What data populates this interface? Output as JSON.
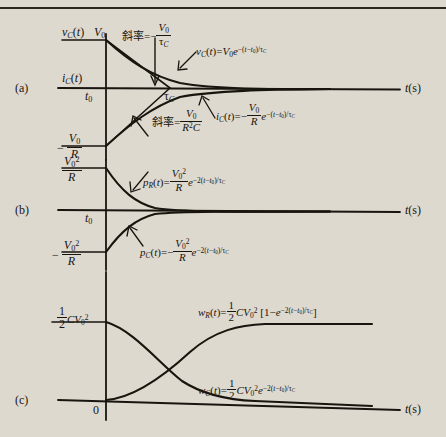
{
  "figure": {
    "background_color": "#ded9cf",
    "ink_color": "#18150f",
    "panels": [
      {
        "id": "a",
        "label": "(a)",
        "axis_label": "t(s)",
        "origin_label": "t_0"
      },
      {
        "id": "b",
        "label": "(b)",
        "axis_label": "t(s)",
        "origin_label": "t_0"
      },
      {
        "id": "c",
        "label": "(c)",
        "axis_label": "t(s)",
        "origin_label": "0"
      }
    ],
    "panel_a": {
      "panel_label": "(a)",
      "y_axis_top_label": "v_C(t)",
      "y_axis_top_value": "V_0",
      "y_axis_mid_label": "i_C(t)",
      "y_axis_neg_value": "- V_0/R",
      "origin_label": "t_0",
      "tau_label": "τ_C",
      "t_axis_label": "t(s)",
      "slope_top_text": "斜率",
      "slope_top_value": "- V_0/τ_C",
      "slope_bottom_text": "斜率",
      "slope_bottom_value": "V_0/R²C",
      "curve_vc_formula": "v_C(t)=V_0 e^{-(t-t_0)/τ_C}",
      "curve_ic_formula": "i_C(t)=- (V_0/R) e^{-(t-t_0)/τ_C}"
    },
    "panel_b": {
      "panel_label": "(b)",
      "y_axis_pos_value": "V_0²/R",
      "y_axis_neg_value": "- V_0²/R",
      "origin_label": "t_0",
      "t_axis_label": "t(s)",
      "curve_pr_formula": "p_R(t)=(V_0²/R) e^{-2(t-t_0)/τ_C}",
      "curve_pc_formula": "p_C(t)=-(V_0²/R) e^{-2(t-t_0)/τ_C}"
    },
    "panel_c": {
      "panel_label": "(c)",
      "y_axis_pos_value": "(1/2)CV_0²",
      "origin_label": "0",
      "t_axis_label": "t(s)",
      "curve_wr_formula": "w_R(t)=(1/2)CV_0² [1-e^{-2(t-t_0)/τ_C}]",
      "curve_wc_formula": "w_C(t)=(1/2)CV_0² e^{-2(t-t_0)/τ_C}"
    }
  }
}
